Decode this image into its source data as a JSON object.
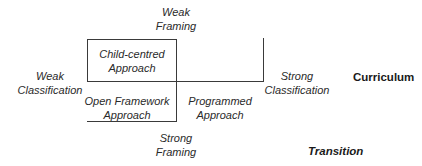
{
  "diagram": {
    "title_axis": {
      "top": {
        "line1": "Weak",
        "line2": "Framing"
      },
      "bottom": {
        "line1": "Strong",
        "line2": "Framing"
      },
      "left": {
        "line1": "Weak",
        "line2": "Classification"
      },
      "right": {
        "line1": "Strong",
        "line2": "Classification"
      }
    },
    "quadrants": {
      "top_left": {
        "line1": "Child-centred",
        "line2": "Approach"
      },
      "bottom_left": {
        "line1": "Open Framework",
        "line2": "Approach"
      },
      "bottom_right": {
        "line1": "Programmed",
        "line2": "Approach"
      }
    },
    "headings": {
      "curriculum": "Curriculum",
      "transition": "Transition"
    },
    "colors": {
      "line": "#3a3a3a",
      "text": "#2a2a2a",
      "background": "#ffffff"
    }
  }
}
